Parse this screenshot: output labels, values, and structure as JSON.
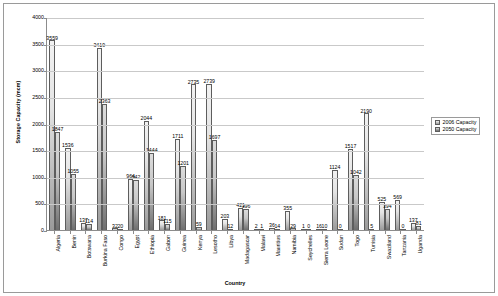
{
  "chart_data": {
    "type": "bar",
    "title": "",
    "xlabel": "Country",
    "ylabel": "Storage Capacity (mcm)",
    "ylim": [
      0,
      4000
    ],
    "ytick_values": [
      0,
      500,
      1000,
      1500,
      2000,
      2500,
      3000,
      3500,
      4000
    ],
    "ytick_labels": [
      "0",
      "500",
      "1000",
      "1500",
      "2000",
      "2500",
      "3000",
      "3500",
      "4000"
    ],
    "grid": true,
    "legend_position": "right",
    "categories": [
      "Algeria",
      "Benin",
      "Botswana",
      "Burkina Faso",
      "Congo",
      "Egypt",
      "Ethiopia",
      "Gabon",
      "Guinea",
      "Kenya",
      "Lesotho",
      "Libya",
      "Madagascar",
      "Malawi",
      "Mauritius",
      "Namibia",
      "Seychelles",
      "Sierra Leone",
      "Sudan",
      "Togo",
      "Tunisia",
      "Swaziland",
      "Tanzania",
      "Uganda"
    ],
    "series": [
      {
        "name": "2006 Capacity",
        "color": "#e4e4e4",
        "values": [
          3559,
          1536,
          137,
          3419,
          32,
          964,
          2044,
          181,
          1711,
          2735,
          2739,
          203,
          421,
          2,
          36,
          355,
          1,
          16,
          1124,
          1517,
          2190,
          525,
          569,
          137
        ]
      },
      {
        "name": "2050 Capacity",
        "color": "#9a9a9a",
        "values": [
          1847,
          1055,
          114,
          2363,
          20,
          942,
          1444,
          115,
          1201,
          59,
          1697,
          12,
          396,
          1,
          14,
          29,
          0,
          10,
          0,
          1042,
          5,
          394,
          0,
          81
        ]
      }
    ],
    "data_labels": {
      "series_2006": [
        "3559",
        "1536",
        "137",
        "3419",
        "32",
        "964",
        "2044",
        "181",
        "1711",
        "2735",
        "2739",
        "203",
        "421",
        "2",
        "36",
        "355",
        "1",
        "16",
        "1124",
        "1517",
        "2190",
        "525",
        "569",
        "137"
      ],
      "series_2050": [
        "1847",
        "1055",
        "114",
        "2363",
        "20",
        "942",
        "1444",
        "115",
        "1201",
        "59",
        "1697",
        "12",
        "396",
        "1",
        "14",
        "29",
        "0",
        "10",
        "0",
        "1042",
        "5",
        "394",
        "0",
        "81"
      ]
    }
  },
  "legend": {
    "items": [
      {
        "label": "2006 Capacity"
      },
      {
        "label": "2050 Capacity"
      }
    ]
  }
}
